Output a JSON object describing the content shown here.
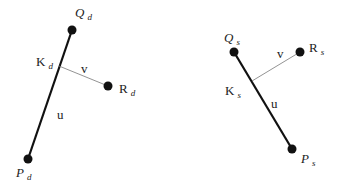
{
  "diagrams": [
    {
      "id": "d",
      "points": {
        "Q": {
          "label": "Q",
          "sub": "d",
          "x": 72,
          "y": 30
        },
        "P": {
          "label": "P",
          "sub": "d",
          "x": 28,
          "y": 159
        },
        "K": {
          "label": "K",
          "sub": "d",
          "x": 59,
          "y": 66
        },
        "R": {
          "label": "R",
          "sub": "d",
          "x": 108,
          "y": 86
        }
      },
      "segments": {
        "u": "u",
        "v": "v"
      }
    },
    {
      "id": "s",
      "points": {
        "Q": {
          "label": "Q",
          "sub": "s",
          "x": 234,
          "y": 52
        },
        "P": {
          "label": "P",
          "sub": "s",
          "x": 292,
          "y": 149
        },
        "K": {
          "label": "K",
          "sub": "s",
          "x": 252,
          "y": 81
        },
        "R": {
          "label": "R",
          "sub": "s",
          "x": 300,
          "y": 52
        }
      },
      "segments": {
        "u": "u",
        "v": "v"
      }
    }
  ]
}
